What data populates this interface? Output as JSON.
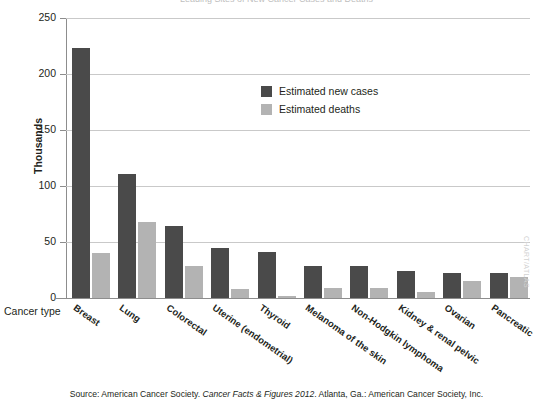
{
  "figure": {
    "title_sliver": "Leading Sites of New Cancer Cases and Deaths",
    "x_axis_title": "Cancer type",
    "y_axis_title": "Thousands",
    "side_credit": "CHART/ATLAS"
  },
  "legend": {
    "items": [
      {
        "label": "Estimated new cases",
        "color": "#4a4a4a",
        "key": "cases"
      },
      {
        "label": "Estimated deaths",
        "color": "#b3b3b3",
        "key": "deaths"
      }
    ]
  },
  "source": {
    "prefix": "Source: American Cancer Society. ",
    "italic": "Cancer Facts & Figures 2012",
    "suffix": ". Atlanta, Ga.: American Cancer Society, Inc."
  },
  "chart_data": {
    "type": "bar",
    "title": "Leading Sites of New Cancer Cases and Deaths",
    "xlabel": "Cancer type",
    "ylabel": "Thousands",
    "ylim": [
      0,
      250
    ],
    "yticks": [
      0,
      50,
      100,
      150,
      200,
      250
    ],
    "grid": true,
    "legend_position": "inside-upper-center",
    "categories": [
      "Breast",
      "Lung",
      "Colorectal",
      "Uterine (endometrial)",
      "Thyroid",
      "Melanoma of the skin",
      "Non-Hodgkin lymphoma",
      "Kidney & renal pelvic",
      "Ovarian",
      "Pancreatic"
    ],
    "series": [
      {
        "name": "Estimated new cases",
        "color": "#4a4a4a",
        "values": [
          223,
          111,
          64,
          45,
          41,
          29,
          29,
          24,
          22,
          22
        ]
      },
      {
        "name": "Estimated deaths",
        "color": "#b3b3b3",
        "values": [
          40,
          68,
          29,
          8,
          2,
          9,
          9,
          5,
          15,
          19
        ]
      }
    ]
  }
}
